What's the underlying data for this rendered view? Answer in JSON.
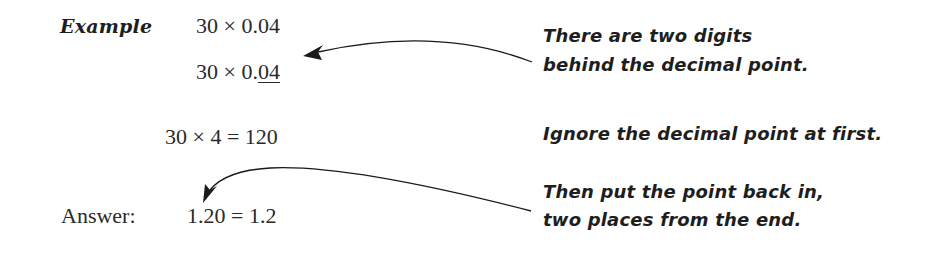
{
  "example": {
    "label": "Example",
    "line1": "30 × 0.04",
    "line2_prefix": "30 × 0.",
    "line2_underlined": "04",
    "line3": "30 × 4 = 120",
    "answer_label": "Answer:",
    "answer_value": "1.20 = 1.2"
  },
  "notes": {
    "note1_line1": "There are two digits",
    "note1_line2": "behind the decimal point.",
    "note2": "Ignore the decimal point at first.",
    "note3_line1": "Then put the point back in,",
    "note3_line2": "two places from the end."
  },
  "colors": {
    "text": "#2a2a2a",
    "arrow": "#1a1a1a",
    "background": "#ffffff"
  }
}
